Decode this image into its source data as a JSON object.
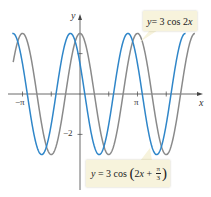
{
  "chart_data": {
    "type": "line",
    "title": "",
    "xlabel": "x",
    "ylabel": "y",
    "x_ticks": [
      {
        "value": -3.14159,
        "label": "−π"
      },
      {
        "value": -1.5708,
        "label": ""
      },
      {
        "value": 1.5708,
        "label": ""
      },
      {
        "value": 3.14159,
        "label": "π"
      },
      {
        "value": 4.7124,
        "label": ""
      }
    ],
    "y_ticks": [
      {
        "value": -2,
        "label": "−2"
      },
      {
        "value": 2,
        "label": ""
      }
    ],
    "xlim": [
      -4.3,
      7.0
    ],
    "ylim": [
      -4.8,
      4.7
    ],
    "grid": false,
    "legend": "annotation callouts",
    "series": [
      {
        "name": "y = 3 cos 2x",
        "expression": "3*cos(2*x)",
        "color": "#8a8a8a",
        "amplitude": 3,
        "period": 3.14159,
        "phase_shift": 0,
        "x_range": [
          -3.65,
          6.28
        ]
      },
      {
        "name": "y = 3 cos(2x + π/3)",
        "expression": "3*cos(2*x + pi/3)",
        "color": "#2f86c9",
        "amplitude": 3,
        "period": 3.14159,
        "phase_shift": -0.5236,
        "x_range": [
          -3.7,
          5.77
        ]
      }
    ]
  },
  "labels": {
    "axis_x": "x",
    "axis_y": "y",
    "tick_neg_pi": "−π",
    "tick_pi": "π",
    "tick_neg2": "−2",
    "callout1": {
      "prefix": "y",
      "text": " = 3 cos 2",
      "var": "x"
    },
    "callout2": {
      "prefix": "y",
      "text": " = 3 cos ",
      "open": "(",
      "inner": "2",
      "var": "x",
      "plus": " + ",
      "num": "π",
      "den": "3",
      "close": ")"
    }
  },
  "colors": {
    "gray_curve": "#8a8a8a",
    "blue_curve": "#2f86c9",
    "axis": "#444444",
    "callout_bg": "#f7f3dc"
  }
}
